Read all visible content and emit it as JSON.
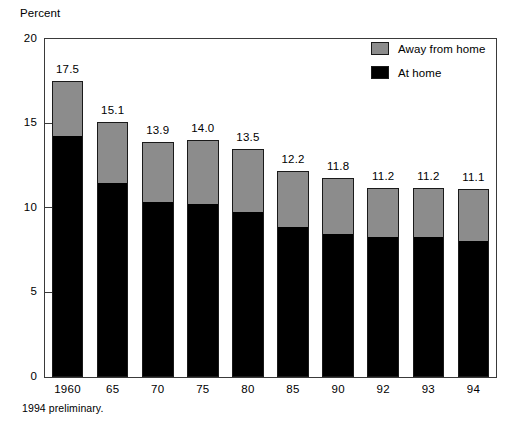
{
  "chart_data": {
    "type": "bar",
    "subtype": "stacked",
    "title": "",
    "xlabel": "",
    "ylabel": "Percent",
    "ylim": [
      0,
      20
    ],
    "yticks": [
      0,
      5,
      10,
      15,
      20
    ],
    "ytick_labels": [
      "0",
      "5",
      "10",
      "15",
      "20"
    ],
    "grid": false,
    "legend_position": "top-right",
    "categories": [
      "1960",
      "65",
      "70",
      "75",
      "80",
      "85",
      "90",
      "92",
      "93",
      "94"
    ],
    "series": [
      {
        "name": "At home",
        "color": "#000000",
        "values": [
          14.2,
          11.4,
          10.3,
          10.2,
          9.7,
          8.8,
          8.4,
          8.2,
          8.2,
          8.0
        ]
      },
      {
        "name": "Away from home",
        "color": "#8c8c8c",
        "values": [
          3.3,
          3.7,
          3.6,
          3.8,
          3.8,
          3.4,
          3.4,
          3.0,
          3.0,
          3.1
        ]
      }
    ],
    "totals": [
      17.5,
      15.1,
      13.9,
      14.0,
      13.5,
      12.2,
      11.8,
      11.2,
      11.2,
      11.1
    ],
    "total_labels": [
      "17.5",
      "15.1",
      "13.9",
      "14.0",
      "13.5",
      "12.2",
      "11.8",
      "11.2",
      "11.2",
      "11.1"
    ],
    "annotations": [
      "1994 preliminary."
    ]
  },
  "legend": {
    "items": [
      {
        "label": "Away from home",
        "color": "#8c8c8c"
      },
      {
        "label": "At home",
        "color": "#000000"
      }
    ]
  },
  "footnote": "1994 preliminary."
}
